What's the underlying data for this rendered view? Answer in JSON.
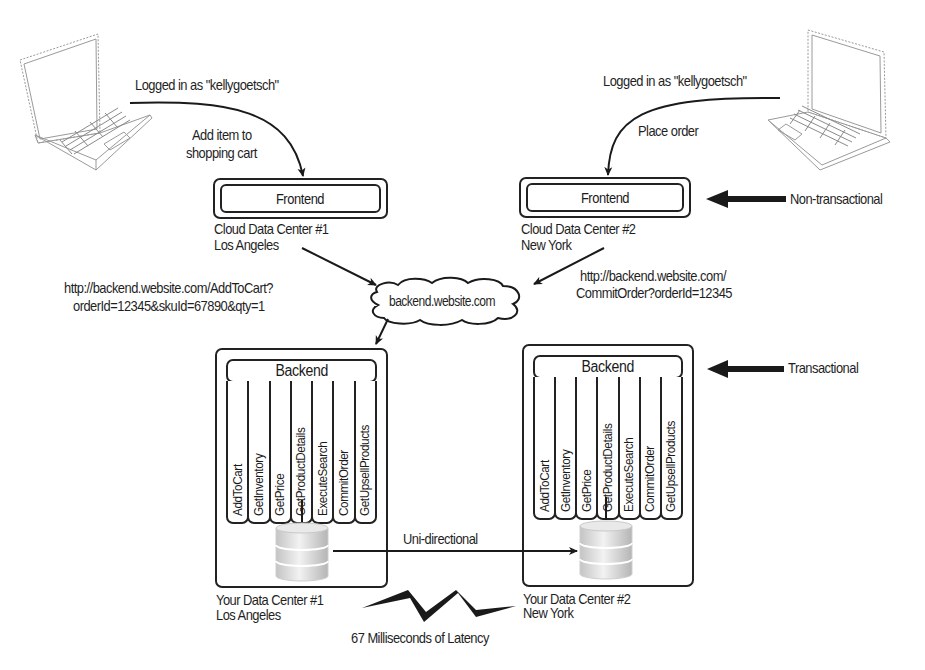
{
  "diagram": {
    "users": [
      {
        "login_label": "Logged in as  \"kellygoetsch\"",
        "action_label_line1": "Add item to",
        "action_label_line2": "shopping cart"
      },
      {
        "login_label": "Logged in as  \"kellygoetsch\"",
        "action_label_line1": "Place order",
        "action_label_line2": ""
      }
    ],
    "frontends": [
      {
        "label": "Frontend",
        "dc_name": "Cloud Data Center #1",
        "city": "Los Angeles"
      },
      {
        "label": "Frontend",
        "dc_name": "Cloud Data Center #2",
        "city": "New York"
      }
    ],
    "requests": [
      {
        "line1": "http://backend.website.com/AddToCart?",
        "line2": "orderId=12345&skuId=67890&qty=1"
      },
      {
        "line1": "http://backend.website.com/",
        "line2": "CommitOrder?orderId=12345"
      }
    ],
    "cloud": {
      "label": "backend.website.com"
    },
    "tiers": {
      "non_transactional": "Non-transactional",
      "transactional": "Transactional"
    },
    "backends": [
      {
        "label": "Backend",
        "dc_name": "Your Data Center #1",
        "city": "Los Angeles",
        "services": [
          "AddToCart",
          "GetInventory",
          "GetPrice",
          "GetProductDetails",
          "ExecuteSearch",
          "CommitOrder",
          "GetUpsellProducts"
        ]
      },
      {
        "label": "Backend",
        "dc_name": "Your Data Center #2",
        "city": "New York",
        "services": [
          "AddToCart",
          "GetInventory",
          "GetPrice",
          "GetProductDetails",
          "ExecuteSearch",
          "CommitOrder",
          "GetUpsellProducts"
        ]
      }
    ],
    "replication": {
      "label": "Uni-directional"
    },
    "latency": {
      "label": "67 Milliseconds of Latency"
    }
  }
}
